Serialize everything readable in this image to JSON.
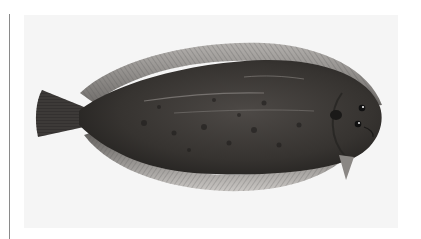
{
  "image": {
    "subject": "Illustration of a sole (flatfish), dorsal view, head facing right",
    "alt_text": "Scientific illustration of a dark-brown mottled sole flatfish with fringed fins"
  },
  "colors": {
    "page_background": "#ffffff",
    "panel_background": "#f5f5f5",
    "left_rule": "#8a8a8a",
    "body_dark": "#2e2c2a",
    "body_mid": "#4a4744",
    "fin": "#8d8a87",
    "fin_edge": "#b9b6b3"
  }
}
